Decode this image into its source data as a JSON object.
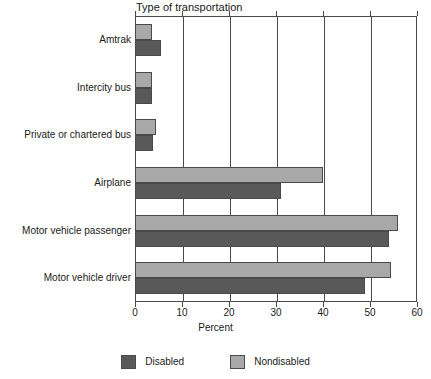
{
  "chart_data": {
    "type": "bar",
    "orientation": "horizontal",
    "title": "Type of transportation",
    "xlabel": "Percent",
    "ylabel": "",
    "xlim": [
      0,
      60
    ],
    "xticks": [
      0,
      10,
      20,
      30,
      40,
      50,
      60
    ],
    "grid": true,
    "legend_position": "bottom",
    "categories": [
      "Amtrak",
      "Intercity bus",
      "Private or chartered bus",
      "Airplane",
      "Motor vehicle passenger",
      "Motor vehicle driver"
    ],
    "series": [
      {
        "name": "Nondisabled",
        "color": "#a8a8a8",
        "values": [
          3.6,
          3.7,
          4.5,
          40.0,
          56.0,
          54.5
        ]
      },
      {
        "name": "Disabled",
        "color": "#595959",
        "values": [
          5.5,
          3.6,
          3.8,
          31.0,
          54.0,
          49.0
        ]
      }
    ]
  },
  "legend": {
    "items": [
      {
        "label": "Disabled",
        "color": "#595959"
      },
      {
        "label": "Nondisabled",
        "color": "#a8a8a8"
      }
    ]
  },
  "axis": {
    "tick_labels": [
      "0",
      "10",
      "20",
      "30",
      "40",
      "50",
      "60"
    ],
    "x_title": "Percent"
  },
  "colors": {
    "disabled": "#595959",
    "nondisabled": "#a8a8a8",
    "axis": "#4a4a4a",
    "background": "#ffffff"
  }
}
